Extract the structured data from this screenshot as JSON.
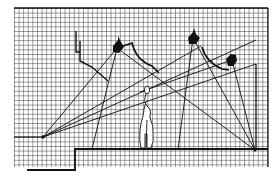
{
  "diagram": {
    "colors": {
      "paper": "#ffffff",
      "grid": "#2a2a2a",
      "ink": "#111111"
    },
    "grid": {
      "x0": 14,
      "y0": 8,
      "x1": 268,
      "y1": 165,
      "pitch": 4.6
    },
    "light_sources": [
      {
        "id": "lamp-left",
        "x": 117,
        "y": 48
      },
      {
        "id": "lamp-center",
        "x": 193,
        "y": 38
      },
      {
        "id": "lamp-right",
        "x": 232,
        "y": 60
      }
    ],
    "focus_points": [
      {
        "id": "point-left",
        "x": 43,
        "y": 137
      },
      {
        "id": "point-right",
        "x": 255,
        "y": 150
      }
    ]
  }
}
